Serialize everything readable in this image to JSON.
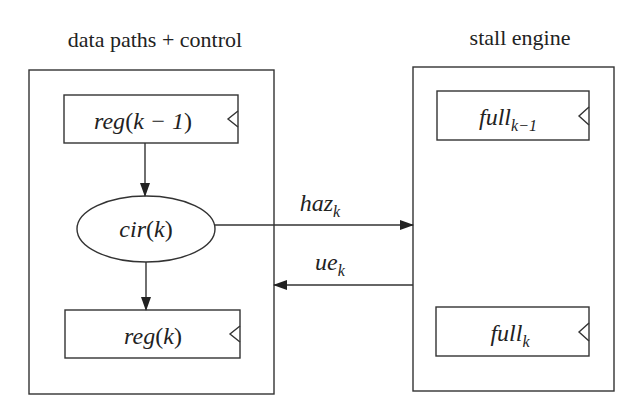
{
  "diagram": {
    "left_module": {
      "title": "data paths + control",
      "top_register": {
        "base": "reg",
        "arg_open": "(",
        "arg": "k − 1",
        "arg_close": ")"
      },
      "circuit": {
        "base": "cir",
        "arg_open": "(",
        "arg": "k",
        "arg_close": ")"
      },
      "bottom_register": {
        "base": "reg",
        "arg_open": "(",
        "arg": "k",
        "arg_close": ")"
      }
    },
    "right_module": {
      "title": "stall engine",
      "top_register": {
        "base": "full",
        "subscript": "k−1"
      },
      "bottom_register": {
        "base": "full",
        "subscript": "k"
      }
    },
    "signals": {
      "hazard": {
        "base": "haz",
        "subscript": "k",
        "direction": "left-to-right"
      },
      "update_enable": {
        "base": "ue",
        "subscript": "k",
        "direction": "right-to-left"
      }
    },
    "colors": {
      "stroke": "#333333",
      "text": "#222222",
      "background": "#ffffff"
    }
  }
}
